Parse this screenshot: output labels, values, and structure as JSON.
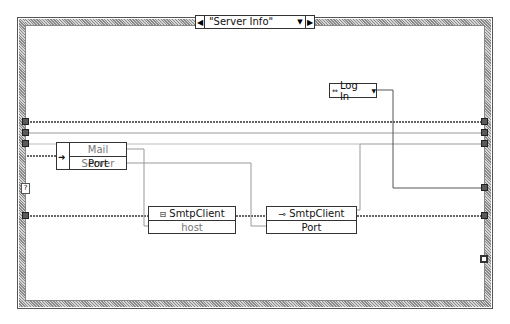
{
  "case_structure": {
    "selector_value": "\"Server Info\"",
    "prev_arrow": "◀",
    "next_arrow": "▶",
    "dropdown_glyph": "▼"
  },
  "bundle_node": {
    "rows": [
      "Mail Server",
      "Port"
    ]
  },
  "property_node_1": {
    "class": "SmtpClient",
    "icon": "constructor-icon",
    "property": "host"
  },
  "property_node_2": {
    "class": "SmtpClient",
    "icon": "property-key-icon",
    "property": "Port"
  },
  "enum_constant": {
    "value": "Log In",
    "dropdown_glyph": "▼"
  },
  "left_tunnels_y": [
    122,
    133,
    144,
    188,
    216
  ],
  "right_tunnels_y": [
    122,
    133,
    144,
    188,
    216
  ],
  "error_terminal_glyph": "?"
}
